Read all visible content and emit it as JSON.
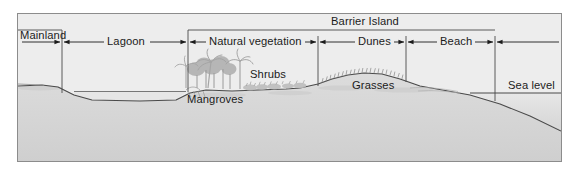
{
  "figure": {
    "kind": "coastal-profile-cross-section",
    "frame_border_color": "#8c8c8c",
    "sky_color": "#ededed",
    "ground_color": "#d9d9d9",
    "water_color": "#e4e4e4",
    "line_color": "#4a4a4a",
    "vegetation_color": "#b9b9b9"
  },
  "labels": {
    "barrier_island": "Barrier Island",
    "mainland": "Mainland",
    "lagoon": "Lagoon",
    "natural_vegetation": "Natural vegetation",
    "dunes": "Dunes",
    "beach": "Beach",
    "sea_level": "Sea level",
    "shrubs": "Shrubs",
    "grasses": "Grasses",
    "mangroves": "Mangroves"
  },
  "zones": [
    {
      "name": "Mainland",
      "x_start": 18,
      "x_end": 62
    },
    {
      "name": "Lagoon",
      "x_start": 62,
      "x_end": 188
    },
    {
      "name": "Natural vegetation",
      "x_start": 188,
      "x_end": 318
    },
    {
      "name": "Dunes",
      "x_start": 318,
      "x_end": 406
    },
    {
      "name": "Beach",
      "x_start": 406,
      "x_end": 495
    },
    {
      "name": "Open ocean",
      "x_start": 495,
      "x_end": 561
    }
  ],
  "barrier_island_span": {
    "x_start": 188,
    "x_end": 495
  },
  "annotations": [
    {
      "text": "Shrubs",
      "x": 250,
      "y": 68
    },
    {
      "text": "Grasses",
      "x": 352,
      "y": 79
    },
    {
      "text": "Mangroves",
      "x": 187,
      "y": 93
    },
    {
      "text": "Sea level",
      "x": 508,
      "y": 79
    }
  ],
  "sea_level_y": 93,
  "divider_x_positions": [
    62,
    188,
    318,
    406,
    495
  ],
  "arrow_row_y": 42
}
